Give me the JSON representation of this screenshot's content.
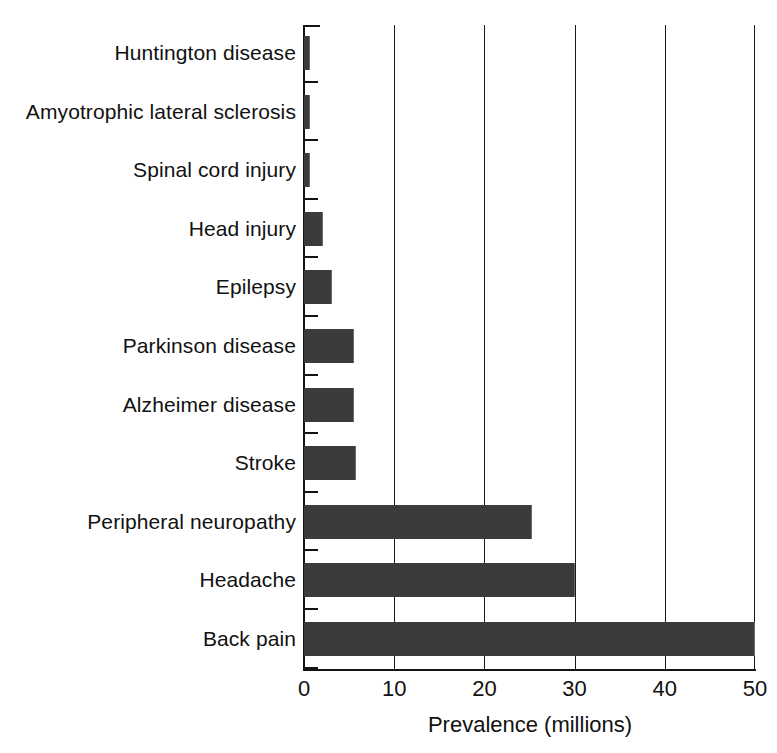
{
  "chart_data": {
    "type": "bar",
    "orientation": "horizontal",
    "title": "",
    "xlabel": "Prevalence (millions)",
    "ylabel": "",
    "xlim": [
      0,
      50
    ],
    "xticks": [
      0,
      10,
      20,
      30,
      40,
      50
    ],
    "xtick_labels": [
      "0",
      "10",
      "20",
      "30",
      "40",
      "50"
    ],
    "grid": "vertical",
    "legend": "none",
    "bar_color": "#3b3b3b",
    "background_color": "#ffffff",
    "categories": [
      "Huntington disease",
      "Amyotrophic lateral sclerosis",
      "Spinal cord injury",
      "Head injury",
      "Epilepsy",
      "Parkinson disease",
      "Alzheimer disease",
      "Stroke",
      "Peripheral neuropathy",
      "Headache",
      "Back pain"
    ],
    "values": [
      0.7,
      0.7,
      0.7,
      2.1,
      3.1,
      5.5,
      5.5,
      5.8,
      25.3,
      30.0,
      50.0
    ],
    "units": "millions"
  }
}
